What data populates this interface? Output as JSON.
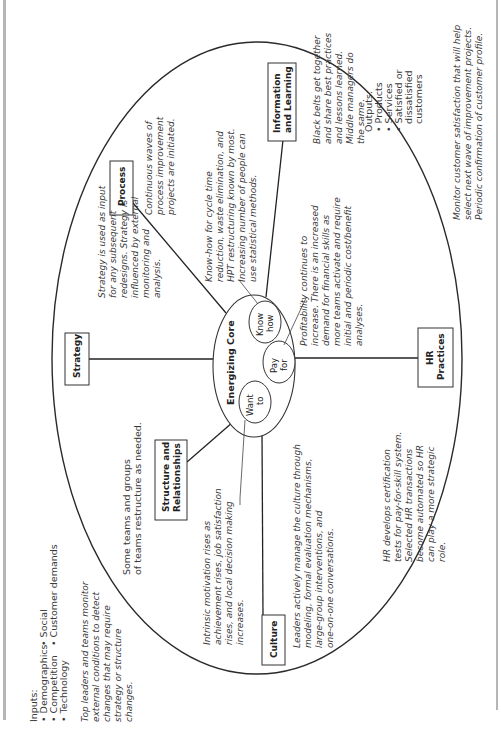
{
  "diagram": {
    "orientation": "rotated -90 degrees (text reads bottom-to-top)",
    "core": {
      "title": "Energizing Core",
      "elements": [
        {
          "line1": "Know",
          "line2": "how"
        },
        {
          "line1": "Pay",
          "line2": "for"
        },
        {
          "line1": "Want",
          "line2": "to"
        }
      ]
    },
    "nodes": {
      "strategy": {
        "label": "Strategy"
      },
      "process": {
        "label": "Process"
      },
      "info": {
        "line1": "Information",
        "line2": "and Learning"
      },
      "hr": {
        "line1": "HR",
        "line2": "Practices"
      },
      "structure": {
        "line1": "Structure and",
        "line2": "Relationships"
      },
      "culture": {
        "label": "Culture"
      }
    },
    "inputs": {
      "heading": "Inputs:",
      "col1": [
        "Demographics",
        "Competition",
        "Technology"
      ],
      "col2": [
        "Social",
        "Customer demands"
      ]
    },
    "outputs": {
      "heading": "Outputs:",
      "items": [
        "Products",
        "Services",
        "Satisfied or",
        "dissatisfied",
        "customers"
      ]
    },
    "notes": {
      "top_leaders": [
        "Top leaders and teams monitor",
        "external conditions to detect",
        "changes that may require",
        "strategy or structure",
        "changes."
      ],
      "strategy": [
        "Strategy is used as input",
        "for any subsequent",
        "redesigns. Strategy is",
        "influenced by external",
        "monitoring and",
        "analysis."
      ],
      "process": [
        "Continuous waves of",
        "process improvement",
        "projects are initiated."
      ],
      "know_how": [
        "Know-how for cycle time",
        "reduction, waste elimination, and",
        "HPT restructuring known by most.",
        "Increasing number of people can",
        "use statistical methods."
      ],
      "info": [
        "Black belts get together",
        "and share best practices",
        "and lessons learned.",
        "Middle managers do",
        "the same."
      ],
      "monitor": [
        "Monitor customer satisfaction that will help",
        "select next wave of improvement projects.",
        "Periodic confirmation of customer profile."
      ],
      "profitability": [
        "Profitability continues to",
        "increase. There is an increased",
        "demand for financial skills as",
        "more teams activate and require",
        "initial and periodic cost/benefit",
        "analyses."
      ],
      "hr": [
        "HR develops certification",
        "tests for pay-for-skill system.",
        "Selected HR transactions",
        "become automated so HR",
        "can play a more strategic",
        "role."
      ],
      "structure": [
        "Some teams and groups",
        "of teams restructure as needed."
      ],
      "intrinsic": [
        "Intrinsic motivation rises as",
        "achievement rises, job satisfaction",
        "rises, and local decision making",
        "increases."
      ],
      "culture": [
        "Leaders actively manage the culture through",
        "modeling, formal evaluation mechanisms,",
        "large-group interventions, and",
        "one-on-one conversations."
      ]
    }
  }
}
